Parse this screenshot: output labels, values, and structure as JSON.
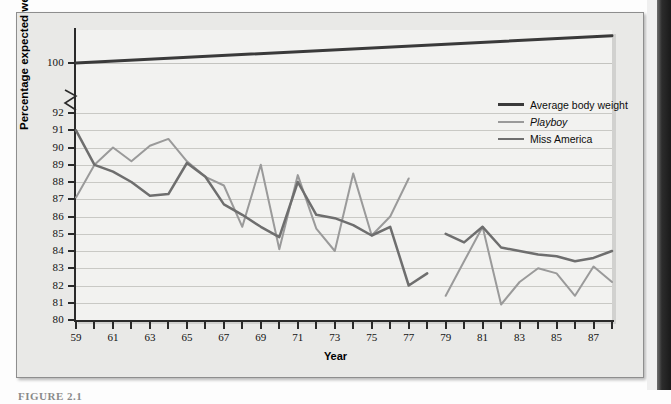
{
  "figure": {
    "caption": "FIGURE 2.1",
    "background_color": "#e9e9e7",
    "panel_color": "#f2f2f0"
  },
  "chart_data": {
    "type": "line",
    "title": "",
    "xlabel": "Year",
    "ylabel": "Percentage expected weight",
    "xlim": [
      59,
      88
    ],
    "ylim": [
      80,
      92
    ],
    "grid": true,
    "legend_position": "upper-right",
    "y_axis_break": {
      "between": [
        92,
        100
      ],
      "style": "zigzag",
      "note": "Axis is broken between 92 and 100"
    },
    "y_tick_labels": [
      "80",
      "81",
      "82",
      "83",
      "84",
      "85",
      "86",
      "87",
      "88",
      "89",
      "90",
      "91",
      "92",
      "100"
    ],
    "x_tick_labels": [
      "59",
      "61",
      "63",
      "65",
      "67",
      "69",
      "71",
      "73",
      "75",
      "77",
      "79",
      "81",
      "83",
      "85",
      "87"
    ],
    "x_minor_ticks_every": 1,
    "colors": {
      "average_body_weight": "#3a3a3a",
      "playboy": "#9a9a9a",
      "miss_america": "#6e6e6e"
    },
    "series": [
      {
        "name": "Average body weight",
        "color": "#3a3a3a",
        "line_width": 3,
        "x": [
          59,
          88
        ],
        "values": [
          100,
          101.6
        ],
        "note": "Straight rising reference line plotted above the axis break"
      },
      {
        "name": "Playboy",
        "color": "#9a9a9a",
        "line_width": 2,
        "style": "italic-label",
        "x": [
          59,
          60,
          61,
          62,
          63,
          64,
          65,
          66,
          67,
          68,
          69,
          70,
          71,
          72,
          73,
          74,
          75,
          76,
          77,
          79,
          80,
          81,
          82,
          83,
          84,
          85,
          86,
          87,
          88
        ],
        "values": [
          87.1,
          89.0,
          90.0,
          89.2,
          90.1,
          90.5,
          89.2,
          88.3,
          87.8,
          85.4,
          89.0,
          84.1,
          88.4,
          85.3,
          84.0,
          88.5,
          84.9,
          86.0,
          88.2,
          81.4,
          83.4,
          85.4,
          80.9,
          82.2,
          83.0,
          82.7,
          81.4,
          83.1,
          82.2
        ],
        "gaps": [
          [
            77,
            79
          ]
        ]
      },
      {
        "name": "Miss America",
        "color": "#6e6e6e",
        "line_width": 2.5,
        "x": [
          59,
          60,
          61,
          62,
          63,
          64,
          65,
          66,
          67,
          68,
          69,
          70,
          71,
          72,
          73,
          74,
          75,
          76,
          77,
          78,
          79,
          80,
          81,
          82,
          83,
          84,
          85,
          86,
          87,
          88
        ],
        "values": [
          91.0,
          89.0,
          88.6,
          88.0,
          87.2,
          87.3,
          89.1,
          88.3,
          86.7,
          86.1,
          85.4,
          84.8,
          88.0,
          86.1,
          85.9,
          85.5,
          84.9,
          85.4,
          82.0,
          82.7,
          85.0,
          84.5,
          85.4,
          84.2,
          84.0,
          83.8,
          83.7,
          83.4,
          83.6,
          84.0
        ],
        "gaps": [
          [
            78,
            79
          ]
        ]
      }
    ],
    "legend_entries": [
      {
        "label": "Average body weight",
        "color": "#3a3a3a",
        "italic": false
      },
      {
        "label": "Playboy",
        "color": "#9a9a9a",
        "italic": true
      },
      {
        "label": "Miss America",
        "color": "#6e6e6e",
        "italic": false
      }
    ]
  }
}
